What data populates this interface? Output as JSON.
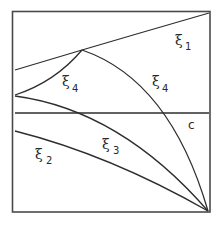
{
  "diagram": {
    "title": "",
    "curves": [
      {
        "id": "xi1",
        "symbol": "ξ",
        "subscript": "1"
      },
      {
        "id": "xi4-left",
        "symbol": "ξ",
        "subscript": "4"
      },
      {
        "id": "xi4-right",
        "symbol": "ξ",
        "subscript": "4"
      },
      {
        "id": "xi3",
        "symbol": "ξ",
        "subscript": "3"
      },
      {
        "id": "xi2",
        "symbol": "ξ",
        "subscript": "2"
      }
    ],
    "line_c": {
      "label": "c"
    }
  }
}
